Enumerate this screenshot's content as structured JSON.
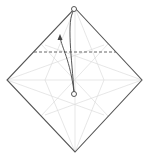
{
  "diagram": {
    "type": "origami-fold-step",
    "colors": {
      "outline": "#555555",
      "crease": "#dddddd",
      "fold_line": "#666666",
      "arrow": "#444444",
      "background": "#ffffff"
    },
    "square": {
      "top": [
        75,
        8
      ],
      "right": [
        142,
        80
      ],
      "bottom": [
        75,
        152
      ],
      "left": [
        7,
        80
      ]
    },
    "valley_fold_line": {
      "x1": 34,
      "y1": 52,
      "x2": 116,
      "y2": 52,
      "style": "dashed"
    },
    "markers": [
      {
        "name": "top-corner-circle",
        "cx": 74,
        "cy": 9,
        "r": 2.5
      },
      {
        "name": "center-target-circle",
        "cx": 74,
        "cy": 94,
        "r": 2.5
      }
    ],
    "arrow": {
      "from": "center",
      "to": "top-corner",
      "direction": "fold-up"
    }
  }
}
